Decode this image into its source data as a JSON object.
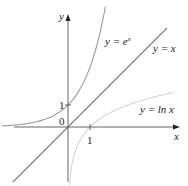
{
  "chart_data": {
    "type": "line",
    "title": "",
    "xlabel": "x",
    "ylabel": "y",
    "origin_label": "0",
    "x_ticks": [
      {
        "value": 1,
        "label": "1"
      }
    ],
    "y_ticks": [
      {
        "value": 1,
        "label": "1"
      }
    ],
    "xlim": [
      -3,
      4.8
    ],
    "ylim": [
      -2.6,
      5.5
    ],
    "grid": false,
    "legend": "none",
    "series": [
      {
        "name": "y = e^x",
        "label": "y = e",
        "label_sup": "x",
        "function": "exp(x)",
        "color": "#9a9a9a",
        "x": [
          -3,
          -2,
          -1,
          0,
          0.5,
          1,
          1.5,
          1.7
        ],
        "y": [
          0.05,
          0.14,
          0.37,
          1,
          1.65,
          2.72,
          4.48,
          5.47
        ]
      },
      {
        "name": "y = x",
        "label": "y = x",
        "function": "x",
        "color": "#6e6e6e",
        "x": [
          -2.5,
          0,
          4.5
        ],
        "y": [
          -2.5,
          0,
          4.5
        ]
      },
      {
        "name": "y = ln x",
        "label": "y = ln x",
        "function": "ln(x)",
        "color": "#d4d4d4",
        "x": [
          0.07,
          0.15,
          0.3,
          0.5,
          1,
          2,
          3,
          4.8
        ],
        "y": [
          -2.6,
          -1.9,
          -1.2,
          -0.69,
          0,
          0.69,
          1.1,
          1.57
        ]
      }
    ]
  }
}
